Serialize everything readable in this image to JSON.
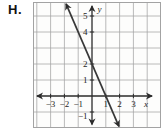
{
  "figure_label": "H.",
  "chart_data": {
    "type": "line",
    "title": "",
    "xlabel": "x",
    "ylabel": "y",
    "grid": true,
    "x_grid_range": [
      -4,
      5
    ],
    "y_grid_range": [
      -1,
      5
    ],
    "x_visible_range": [
      -4.28,
      5.0
    ],
    "y_visible_range": [
      -2.0,
      5.875
    ],
    "x_ticks": [
      {
        "v": -3,
        "label": "−3"
      },
      {
        "v": -2,
        "label": "−2"
      },
      {
        "v": -1,
        "label": "−1"
      },
      {
        "v": 1,
        "label": "1"
      },
      {
        "v": 2,
        "label": "2"
      },
      {
        "v": 3,
        "label": "3"
      }
    ],
    "y_ticks": [
      {
        "v": 5,
        "label": "5"
      },
      {
        "v": 4,
        "label": "4"
      },
      {
        "v": 2,
        "label": "2"
      },
      {
        "v": 1,
        "label": "1"
      },
      {
        "v": -1,
        "label": "−1"
      }
    ],
    "series": [
      {
        "name": "line-1",
        "equation": "y = -2x + 2",
        "slope": -2,
        "y_intercept": 2,
        "x_intercept": 1,
        "points": [
          [
            0,
            2
          ],
          [
            1,
            0
          ]
        ],
        "drawn_segment": [
          [
            -1.88,
            5.76
          ],
          [
            1.95,
            -1.9
          ]
        ]
      }
    ],
    "colors": {
      "background": "#ffffff",
      "plot_background": "#fdfdfc",
      "grid_line": "#a3a3a3",
      "axis": "#2b2b2b",
      "plot_line": "#383838",
      "label_text": "#1f1f1f"
    }
  }
}
